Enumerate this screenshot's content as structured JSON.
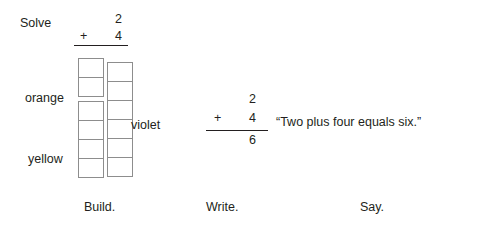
{
  "solve": {
    "label": "Solve",
    "addend1": "2",
    "operator": "+",
    "addend2": "4"
  },
  "build": {
    "towers": [
      {
        "name": "addends-tower",
        "groups": [
          {
            "label": "orange",
            "count": 2,
            "color": "#ffffff"
          },
          {
            "label": "yellow",
            "count": 4,
            "color": "#ffffff"
          }
        ]
      },
      {
        "name": "sum-tower",
        "groups": [
          {
            "label": "violet",
            "count": 6,
            "color": "#ffffff"
          }
        ]
      }
    ],
    "labels": {
      "orange": "orange",
      "yellow": "yellow",
      "violet": "violet"
    }
  },
  "write": {
    "addend1": "2",
    "operator": "+",
    "addend2": "4",
    "sum": "6"
  },
  "say": {
    "sentence": "“Two plus four equals six.”"
  },
  "captions": {
    "build": "Build.",
    "write": "Write.",
    "say": "Say."
  },
  "colors": {
    "text": "#231f20",
    "cube_outline": "#8d8d8d",
    "background": "#ffffff"
  }
}
